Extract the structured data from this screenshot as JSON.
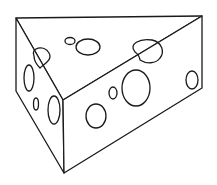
{
  "illustration": {
    "subject": "cheese wedge",
    "style": "black line art on white",
    "colors": {
      "background": "#ffffff",
      "line": "#1a1a1a",
      "fill": "#ffffff"
    },
    "faces": {
      "top": "M16 18 L202 16 L63 100 Z",
      "left": "M16 18 L63 100 L64 173 L16 91 Z",
      "front": "M63 100 L202 16 L202 88 L64 173 Z"
    },
    "holes": {
      "top": [
        {
          "cx": 70,
          "cy": 41,
          "rx": 5,
          "ry": 3.5
        },
        {
          "cx": 88,
          "cy": 47,
          "rx": 12,
          "ry": 8
        }
      ],
      "left": [
        {
          "cx": 29,
          "cy": 78,
          "rx": 5,
          "ry": 13
        },
        {
          "cx": 36,
          "cy": 104,
          "rx": 2.5,
          "ry": 6
        },
        {
          "cx": 54,
          "cy": 110,
          "rx": 6,
          "ry": 14
        }
      ],
      "front": [
        {
          "cx": 96,
          "cy": 116,
          "rx": 10,
          "ry": 12
        },
        {
          "cx": 113,
          "cy": 93,
          "rx": 4,
          "ry": 6
        },
        {
          "cx": 136,
          "cy": 88,
          "rx": 14,
          "ry": 18
        },
        {
          "cx": 192,
          "cy": 80,
          "rx": 6,
          "ry": 9
        }
      ]
    },
    "edge_notches": {
      "left": "M34 56 C 30 48, 44 44, 49 53 C 53 60, 44 64, 40 68 C 36 64, 34 60, 34 56 Z",
      "right": "M135 52 C 128 44, 140 38, 152 40 C 162 42, 165 52, 160 58 C 156 64, 146 64, 140 60 C 140 58, 138 54, 135 52 Z"
    }
  }
}
